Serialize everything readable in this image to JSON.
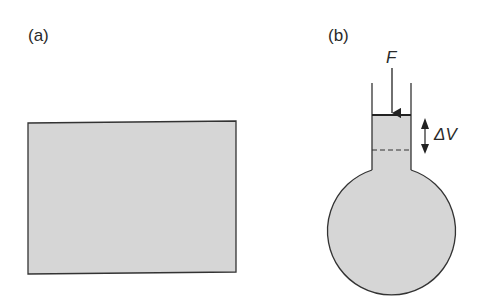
{
  "panels": {
    "a": {
      "label": "(a)"
    },
    "b": {
      "label": "(b)",
      "force_label": "F",
      "volume_label": "ΔV"
    }
  },
  "colors": {
    "fill": "#d6d6d6",
    "stroke": "#333333",
    "background": "#ffffff"
  }
}
